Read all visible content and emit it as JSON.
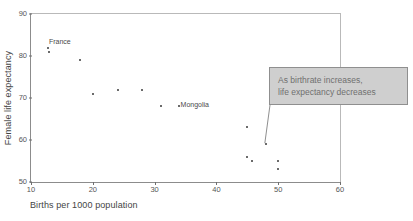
{
  "chart_data": {
    "type": "scatter",
    "title": "",
    "xlabel": "Births per 1000 population",
    "ylabel": "Female life expectancy",
    "xlim": [
      10,
      60
    ],
    "ylim": [
      50,
      90
    ],
    "xticks": [
      10,
      20,
      30,
      40,
      50,
      60
    ],
    "yticks": [
      50,
      60,
      70,
      80,
      90
    ],
    "grid": false,
    "legend": null,
    "points": [
      {
        "x": 12.8,
        "y": 82.0,
        "label": "France"
      },
      {
        "x": 12.9,
        "y": 81.0,
        "label": ""
      },
      {
        "x": 18.0,
        "y": 79.0,
        "label": ""
      },
      {
        "x": 20.0,
        "y": 71.0,
        "label": ""
      },
      {
        "x": 24.0,
        "y": 72.0,
        "label": ""
      },
      {
        "x": 28.0,
        "y": 72.0,
        "label": ""
      },
      {
        "x": 31.0,
        "y": 68.0,
        "label": ""
      },
      {
        "x": 34.0,
        "y": 68.0,
        "label": "Mongolia"
      },
      {
        "x": 45.0,
        "y": 63.0,
        "label": ""
      },
      {
        "x": 45.0,
        "y": 56.0,
        "label": ""
      },
      {
        "x": 45.8,
        "y": 55.0,
        "label": ""
      },
      {
        "x": 48.0,
        "y": 59.0,
        "label": ""
      },
      {
        "x": 50.0,
        "y": 55.0,
        "label": ""
      },
      {
        "x": 50.0,
        "y": 53.0,
        "label": ""
      }
    ],
    "point_labels": [
      {
        "text": "France",
        "x": 12.9,
        "y": 84.2
      },
      {
        "text": "Mongolia",
        "x": 34.2,
        "y": 69.3
      }
    ],
    "annotations": [
      {
        "id": "trend-callout",
        "lines": [
          "As birthrate increases,",
          "life expectancy decreases"
        ],
        "anchor_point": {
          "x": 48.0,
          "y": 59.0
        },
        "box_fill": "#cfcfcf",
        "box_border": "#8f8f8f",
        "text_color": "#707070"
      }
    ],
    "colors": {
      "point": "#3a3a3a",
      "axis": "#8c8c8c",
      "text": "#555555",
      "leader_line": "#8f8f8f"
    }
  },
  "cropped_header": {
    "text": ""
  }
}
